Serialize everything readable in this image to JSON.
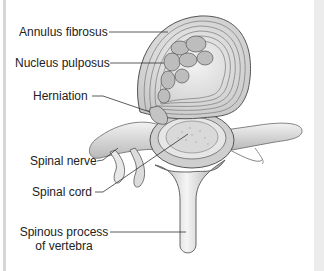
{
  "figure": {
    "labels": {
      "annulus_fibrosus": "Annulus fibrosus",
      "nucleus_pulposus": "Nucleus pulposus",
      "herniation": "Herniation",
      "spinal_nerve": "Spinal nerve",
      "spinal_cord": "Spinal cord",
      "spinous_process_line1": "Spinous process",
      "spinous_process_line2": "of vertebra"
    }
  }
}
